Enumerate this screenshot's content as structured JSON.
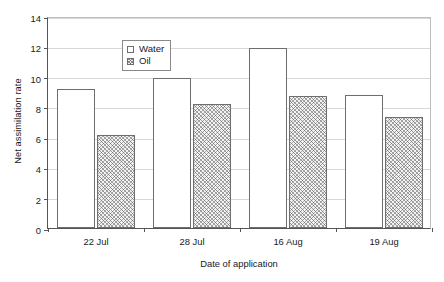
{
  "chart_data": {
    "type": "bar",
    "title": "",
    "xlabel": "Date of application",
    "ylabel": "Net assimilation rate",
    "categories": [
      "22 Jul",
      "28 Jul",
      "16 Aug",
      "19 Aug"
    ],
    "series": [
      {
        "name": "Water",
        "values": [
          9.2,
          9.9,
          11.9,
          8.8
        ]
      },
      {
        "name": "Oil",
        "values": [
          6.15,
          8.2,
          8.75,
          7.35
        ]
      }
    ],
    "ylim": [
      0,
      14
    ],
    "yticks": [
      0,
      2,
      4,
      6,
      8,
      10,
      12,
      14
    ],
    "ytick_labels": [
      "0",
      "2",
      "4",
      "6",
      "8",
      "10",
      "12",
      "14"
    ],
    "grid": true,
    "grid_axis": "y",
    "legend_position": "top-left-inside",
    "legend_entries": [
      {
        "label": "Water",
        "fill": "white"
      },
      {
        "label": "Oil",
        "fill": "hatched"
      }
    ],
    "colors": {
      "bar_outline": "#6e6e6e",
      "water_fill": "#ffffff",
      "oil_fill": "#f2f2f2",
      "gridline": "#d8d8d8",
      "axis": "#555555",
      "text": "#1a1a1a"
    }
  },
  "axes": {
    "y_title": "Net assimilation rate",
    "x_title": "Date of application"
  },
  "legend": {
    "water_label": "Water",
    "oil_label": "Oil"
  }
}
